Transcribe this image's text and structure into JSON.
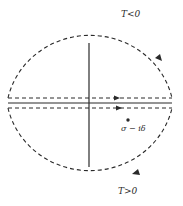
{
  "figure": {
    "type": "complex-plane contour diagram",
    "labels": {
      "upper": "T<0",
      "lower": "T>0",
      "point": "σ − iδ"
    },
    "colors": {
      "ink": "#2a2a2a",
      "background": "#ffffff"
    },
    "elements": {
      "circle_contour": "dashed circle",
      "real_axis": "solid horizontal line",
      "imaginary_axis": "solid vertical line",
      "upper_line": "dashed line above real axis, arrow pointing right",
      "lower_line": "dashed line below real axis, arrow pointing right",
      "upper_arc_arrow": "arrow on right side of upper arc",
      "lower_arc_arrow": "arrow on lower-right arc",
      "pole": "dot below real axis"
    }
  }
}
